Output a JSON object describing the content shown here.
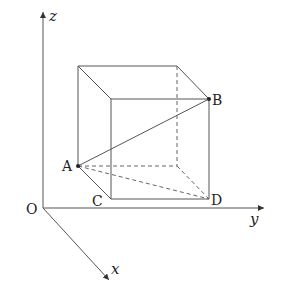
{
  "diagram": {
    "type": "3d-coordinate-cube",
    "axes": {
      "origin_label": "O",
      "x_label": "x",
      "y_label": "y",
      "z_label": "z"
    },
    "points": {
      "A": "A",
      "B": "B",
      "C": "C",
      "D": "D"
    },
    "colors": {
      "line": "#555555",
      "text": "#222222"
    }
  }
}
